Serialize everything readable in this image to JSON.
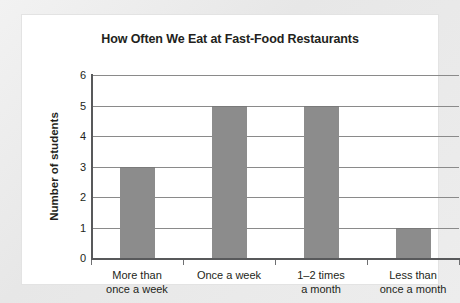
{
  "chart_data": {
    "type": "bar",
    "title": "How Often We Eat at Fast-Food Restaurants",
    "xlabel": "",
    "ylabel": "Number of students",
    "categories": [
      "More than once a week",
      "Once a week",
      "1–2 times a month",
      "Less than once a month"
    ],
    "category_lines": [
      [
        "More than",
        "once a week"
      ],
      [
        "Once a week",
        ""
      ],
      [
        "1–2 times",
        "a month"
      ],
      [
        "Less than",
        "once a month"
      ]
    ],
    "values": [
      3,
      5,
      5,
      1
    ],
    "ylim": [
      0,
      6
    ],
    "yticks": [
      0,
      1,
      2,
      3,
      4,
      5,
      6
    ],
    "ytick_labels": [
      "0",
      "1",
      "2",
      "3",
      "4",
      "5",
      "6"
    ],
    "grid": true,
    "grid_axis": "y",
    "legend": null,
    "bar_color": "#8c8c8c",
    "axis_color": "#58595b",
    "grid_color": "#8a8a8a",
    "text_color": "#231f20",
    "panel_background": "#ffffff",
    "page_background": "#ececec"
  }
}
